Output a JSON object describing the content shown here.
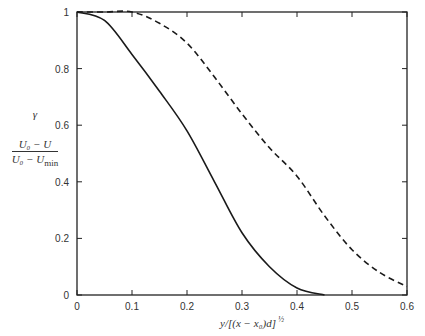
{
  "chart_data": {
    "type": "line",
    "title": "",
    "xlabel": "y/[(x − x₀)d]^½",
    "ylabel": [
      "γ",
      "(U₀ − U)/(U₀ − U_min)"
    ],
    "xlim": [
      0,
      0.6
    ],
    "ylim": [
      0,
      1
    ],
    "xticks": [
      "0",
      "0.1",
      "0.2",
      "0.3",
      "0.4",
      "0.5",
      "0.6"
    ],
    "yticks": [
      "0",
      "0.2",
      "0.4",
      "0.6",
      "0.8",
      "1"
    ],
    "grid": false,
    "legend": null,
    "series": [
      {
        "name": "γ (solid)",
        "style": "solid",
        "x": [
          0,
          0.05,
          0.1,
          0.15,
          0.2,
          0.25,
          0.3,
          0.35,
          0.4,
          0.45
        ],
        "y": [
          1.0,
          0.97,
          0.85,
          0.72,
          0.58,
          0.4,
          0.22,
          0.1,
          0.025,
          0.0
        ]
      },
      {
        "name": "(U₀ − U)/(U₀ − U_min) (dashed)",
        "style": "dashed",
        "x": [
          0,
          0.05,
          0.1,
          0.15,
          0.2,
          0.25,
          0.3,
          0.35,
          0.4,
          0.45,
          0.5,
          0.55,
          0.6
        ],
        "y": [
          1.0,
          1.0,
          1.0,
          0.96,
          0.89,
          0.77,
          0.64,
          0.52,
          0.42,
          0.28,
          0.16,
          0.08,
          0.03
        ]
      }
    ]
  },
  "labels": {
    "gamma": "γ",
    "frac_num": "U₀ − U",
    "frac_den": "U₀ − U",
    "frac_den_sub": "min",
    "xaxis": "y/[(x − x₀)d]",
    "xaxis_exp": "½"
  }
}
